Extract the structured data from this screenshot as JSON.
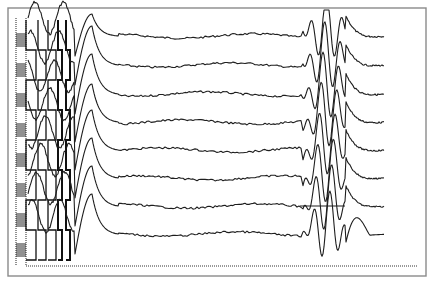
{
  "chart_data": {
    "type": "line",
    "title": "",
    "xlabel": "",
    "ylabel": "",
    "grid": false,
    "legend": null,
    "frame": {
      "x0": 8,
      "y0": 8,
      "x1": 426,
      "y1": 276,
      "color": "#8a8a8a"
    },
    "dotted_baseline_y": 266,
    "trace_color": "#1e1e1e",
    "x_range": [
      26,
      384
    ],
    "series": [
      {
        "name": "trace-1",
        "baseline_y": 36,
        "early_peak": {
          "x": 92,
          "y": 14
        },
        "late_burst_x": [
          306,
          345
        ]
      },
      {
        "name": "trace-2",
        "baseline_y": 65,
        "early_peak": {
          "x": 92,
          "y": 26
        },
        "late_burst_x": [
          306,
          345
        ]
      },
      {
        "name": "trace-3",
        "baseline_y": 94,
        "early_peak": {
          "x": 92,
          "y": 54
        },
        "late_burst_x": [
          306,
          345
        ]
      },
      {
        "name": "trace-4",
        "baseline_y": 122,
        "early_peak": {
          "x": 92,
          "y": 84
        },
        "late_burst_x": [
          306,
          345
        ]
      },
      {
        "name": "trace-5",
        "baseline_y": 150,
        "early_peak": {
          "x": 92,
          "y": 110
        },
        "late_burst_x": [
          306,
          345
        ]
      },
      {
        "name": "trace-6",
        "baseline_y": 178,
        "early_peak": {
          "x": 92,
          "y": 138
        },
        "late_burst_x": [
          306,
          345
        ]
      },
      {
        "name": "trace-7",
        "baseline_y": 206,
        "early_peak": {
          "x": 92,
          "y": 166
        },
        "late_burst_x": [
          306,
          345
        ]
      },
      {
        "name": "trace-8",
        "baseline_y": 234,
        "early_peak": {
          "x": 92,
          "y": 194
        },
        "late_burst_x": [
          306,
          360
        ]
      }
    ],
    "calibration_ladder": {
      "x": [
        16,
        26
      ],
      "y_range": [
        18,
        266
      ],
      "steps": 8
    }
  }
}
